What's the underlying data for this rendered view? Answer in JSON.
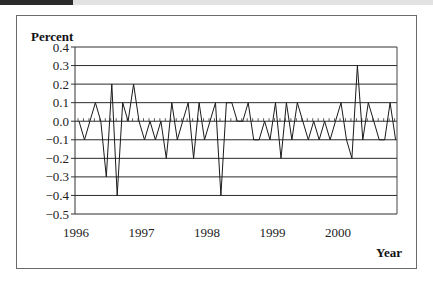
{
  "chart_data": {
    "type": "line",
    "title": "",
    "ylabel": "Percent",
    "xlabel": "Year",
    "ylim": [
      -0.5,
      0.4
    ],
    "yticks": [
      "0.4",
      "0.3",
      "0.2",
      "0.1",
      "0.0",
      "-0.1",
      "-0.2",
      "-0.3",
      "-0.4",
      "-0.5"
    ],
    "xticks": [
      "1996",
      "1997",
      "1998",
      "1999",
      "2000"
    ],
    "grid": true,
    "legend": null,
    "frequency": "monthly",
    "x_start": "1996-01",
    "series": [
      {
        "name": "Percent",
        "values": [
          0.0,
          -0.1,
          0.0,
          0.1,
          0.0,
          -0.3,
          0.2,
          -0.4,
          0.1,
          0.0,
          0.2,
          0.0,
          -0.1,
          0.0,
          -0.1,
          0.0,
          -0.2,
          0.1,
          -0.1,
          0.0,
          0.1,
          -0.2,
          0.1,
          -0.1,
          0.0,
          0.1,
          -0.4,
          0.1,
          0.1,
          0.0,
          0.0,
          0.1,
          -0.1,
          -0.1,
          0.0,
          -0.1,
          0.1,
          -0.2,
          0.1,
          -0.1,
          0.1,
          0.0,
          -0.1,
          0.0,
          -0.1,
          0.0,
          -0.1,
          0.0,
          0.1,
          -0.1,
          -0.2,
          0.3,
          -0.1,
          0.1,
          0.0,
          -0.1,
          -0.1,
          0.1,
          -0.1
        ]
      }
    ]
  },
  "labels": {
    "ylabel": "Percent",
    "xlabel": "Year"
  }
}
